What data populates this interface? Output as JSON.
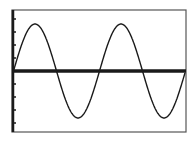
{
  "chart_data": {
    "type": "line",
    "title": "",
    "xlabel": "",
    "ylabel": "",
    "series": [
      {
        "name": "sine curve",
        "shape": "sine",
        "cycles_shown": 2,
        "note": "Periodic sine-shaped curve spanning about two full periods; no numeric axis values are displayed"
      }
    ],
    "axes": {
      "x_axis_visible": true,
      "y_axis_visible": true,
      "y_axis_tick_marks": true,
      "tick_labels": []
    },
    "grid": false,
    "legend": null
  },
  "style": {
    "background": "#ffffff",
    "ink": "#1a1a1a",
    "frame": "#555555"
  },
  "geometry": {
    "frame": {
      "x": 12,
      "y": 10,
      "w": 174,
      "h": 122
    },
    "axis_y_px": 71,
    "y_axis_x_px": 13,
    "amplitude_px": 47,
    "period_px": 86,
    "curve_start_x_px": 13,
    "curve_end_x_px": 185,
    "phase_rad": -0.037,
    "y_tick_spacing_px": 13
  }
}
